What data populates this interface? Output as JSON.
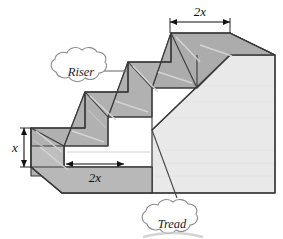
{
  "figure": {
    "background_color": "#ffffff"
  },
  "colors": {
    "face_top_dark": "#a9a9a9",
    "face_step_medium": "#b0b0b0",
    "face_right_light": "#e9e9e9",
    "outline": "#3a3a3a",
    "highlight_line": "#d6d6d6",
    "callout_stroke": "#707070",
    "text": "#111111",
    "shadow": "#c9c9c9"
  },
  "dimensions": [
    {
      "id": "top-width",
      "label": "2x",
      "label_base": "2",
      "label_var": "x",
      "orientation": "horizontal",
      "position": "top"
    },
    {
      "id": "riser-height",
      "label": "x",
      "label_base": "",
      "label_var": "x",
      "orientation": "vertical",
      "position": "left"
    },
    {
      "id": "tread-depth",
      "label": "2x",
      "label_base": "2",
      "label_var": "x",
      "orientation": "horizontal",
      "position": "bottom-left"
    }
  ],
  "callouts": [
    {
      "id": "riser-callout",
      "label": "Riser",
      "position": "upper-left",
      "points_to": "vertical-step-face"
    },
    {
      "id": "tread-callout",
      "label": "Tread",
      "position": "bottom-center",
      "points_to": "horizontal-step-face"
    }
  ]
}
